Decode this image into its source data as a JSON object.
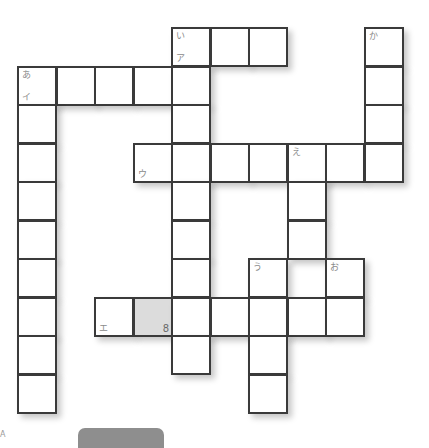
{
  "puzzle": {
    "type": "crossword",
    "origin": {
      "x": 17,
      "y": 27
    },
    "cell_size": 38.5,
    "cells": [
      {
        "c": 4,
        "r": 0,
        "tl": "い",
        "bl": "ア"
      },
      {
        "c": 5,
        "r": 0
      },
      {
        "c": 6,
        "r": 0
      },
      {
        "c": 9,
        "r": 0,
        "tl": "か"
      },
      {
        "c": 0,
        "r": 1,
        "tl": "あ",
        "bl": "イ"
      },
      {
        "c": 1,
        "r": 1
      },
      {
        "c": 2,
        "r": 1
      },
      {
        "c": 3,
        "r": 1
      },
      {
        "c": 4,
        "r": 1
      },
      {
        "c": 9,
        "r": 1
      },
      {
        "c": 0,
        "r": 2
      },
      {
        "c": 4,
        "r": 2
      },
      {
        "c": 9,
        "r": 2
      },
      {
        "c": 0,
        "r": 3
      },
      {
        "c": 3,
        "r": 3,
        "bl": "ウ"
      },
      {
        "c": 4,
        "r": 3
      },
      {
        "c": 5,
        "r": 3
      },
      {
        "c": 6,
        "r": 3
      },
      {
        "c": 7,
        "r": 3,
        "tl": "え"
      },
      {
        "c": 8,
        "r": 3
      },
      {
        "c": 9,
        "r": 3
      },
      {
        "c": 0,
        "r": 4
      },
      {
        "c": 4,
        "r": 4
      },
      {
        "c": 7,
        "r": 4
      },
      {
        "c": 0,
        "r": 5
      },
      {
        "c": 4,
        "r": 5
      },
      {
        "c": 7,
        "r": 5
      },
      {
        "c": 0,
        "r": 6
      },
      {
        "c": 4,
        "r": 6
      },
      {
        "c": 6,
        "r": 6,
        "tl": "う"
      },
      {
        "c": 8,
        "r": 6,
        "tl": "お"
      },
      {
        "c": 0,
        "r": 7
      },
      {
        "c": 2,
        "r": 7,
        "bl": "エ"
      },
      {
        "c": 3,
        "r": 7,
        "br": "8",
        "shaded": true
      },
      {
        "c": 4,
        "r": 7
      },
      {
        "c": 5,
        "r": 7
      },
      {
        "c": 6,
        "r": 7
      },
      {
        "c": 7,
        "r": 7
      },
      {
        "c": 8,
        "r": 7
      },
      {
        "c": 0,
        "r": 8
      },
      {
        "c": 4,
        "r": 8
      },
      {
        "c": 6,
        "r": 8
      },
      {
        "c": 0,
        "r": 9
      },
      {
        "c": 6,
        "r": 9
      }
    ]
  },
  "colors": {
    "border": "#3a3a3a",
    "shaded_cell": "#dcdcdc",
    "label": "#8a8a8a",
    "bottom_tab": "#8e8e8e"
  },
  "footer": {
    "corner_mark": "A"
  }
}
